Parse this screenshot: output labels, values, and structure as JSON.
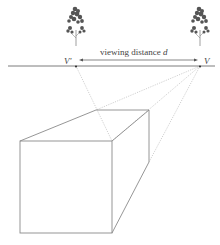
{
  "diagram": {
    "labels": {
      "left_vp": "V'",
      "right_vp": "V",
      "distance_prefix": "viewing distance ",
      "distance_var": "d"
    },
    "colors": {
      "line": "#8a8a8a",
      "dotted": "#bdbdbd",
      "horizon": "#6e6e6e",
      "tree": "#555555",
      "text": "#444444"
    },
    "elements": {
      "horizon_line": "horizon",
      "vanishing_points": [
        "V'",
        "V"
      ],
      "trees": 2,
      "box": "rectangular prism in perspective"
    }
  }
}
